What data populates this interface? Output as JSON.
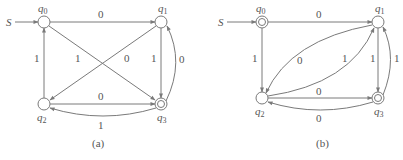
{
  "diagrams": [
    {
      "caption": "(a)",
      "start_label": "S",
      "states": [
        {
          "id": "q0",
          "name": "q",
          "sub": "0",
          "accepting": false
        },
        {
          "id": "q1",
          "name": "q",
          "sub": "1",
          "accepting": false
        },
        {
          "id": "q2",
          "name": "q",
          "sub": "2",
          "accepting": false
        },
        {
          "id": "q3",
          "name": "q",
          "sub": "3",
          "accepting": true
        }
      ],
      "transitions": [
        {
          "from": "q0",
          "to": "q1",
          "label": "0"
        },
        {
          "from": "q0",
          "to": "q3",
          "label": "1"
        },
        {
          "from": "q2",
          "to": "q0",
          "label": "1"
        },
        {
          "from": "q1",
          "to": "q2",
          "label": "0"
        },
        {
          "from": "q1",
          "to": "q3",
          "label": "1"
        },
        {
          "from": "q3",
          "to": "q1",
          "label": "0"
        },
        {
          "from": "q2",
          "to": "q3",
          "label": "0"
        },
        {
          "from": "q3",
          "to": "q2",
          "label": "1"
        }
      ]
    },
    {
      "caption": "(b)",
      "start_label": "S",
      "states": [
        {
          "id": "q0",
          "name": "q",
          "sub": "0",
          "accepting": true
        },
        {
          "id": "q1",
          "name": "q",
          "sub": "1",
          "accepting": false
        },
        {
          "id": "q2",
          "name": "q",
          "sub": "2",
          "accepting": false
        },
        {
          "id": "q3",
          "name": "q",
          "sub": "3",
          "accepting": true
        }
      ],
      "transitions": [
        {
          "from": "q0",
          "to": "q1",
          "label": "0"
        },
        {
          "from": "q0",
          "to": "q2",
          "label": "1"
        },
        {
          "from": "q1",
          "to": "q2",
          "label": "0"
        },
        {
          "from": "q2",
          "to": "q1",
          "label": "1"
        },
        {
          "from": "q1",
          "to": "q3",
          "label": "1"
        },
        {
          "from": "q3",
          "to": "q1",
          "label": "1"
        },
        {
          "from": "q2",
          "to": "q3",
          "label": "0"
        },
        {
          "from": "q3",
          "to": "q2",
          "label": "0"
        }
      ]
    }
  ]
}
